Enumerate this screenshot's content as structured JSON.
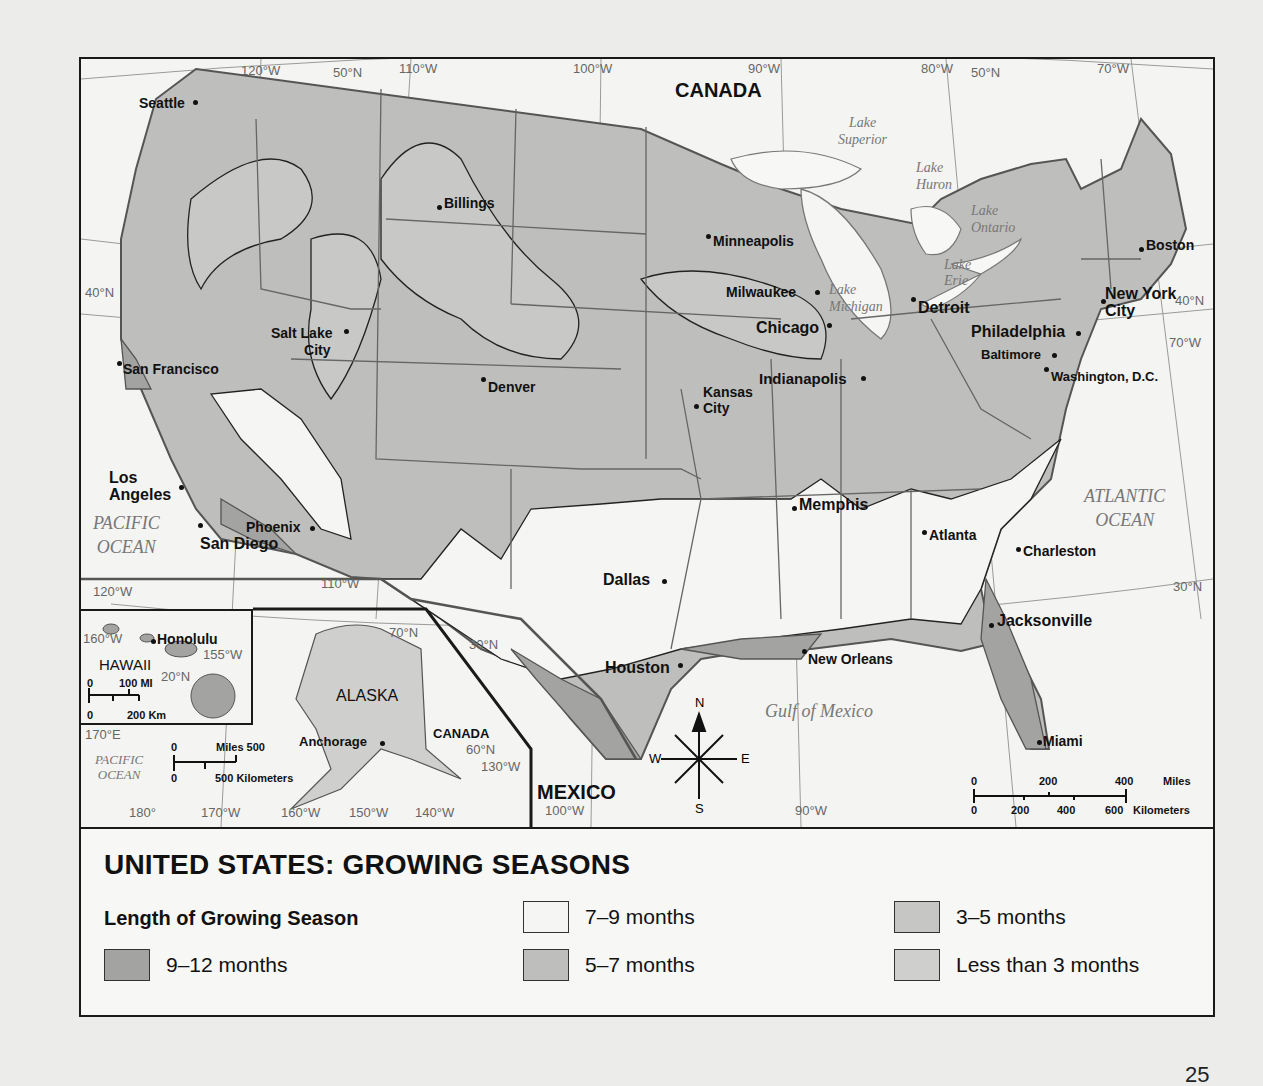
{
  "title": "UNITED STATES: GROWING SEASONS",
  "legend": {
    "heading": "Length of Growing Season",
    "items": [
      {
        "label": "9–12 months",
        "color": "#a3a3a1"
      },
      {
        "label": "7–9 months",
        "color": "#f5f5f3"
      },
      {
        "label": "5–7 months",
        "color": "#bebebc"
      },
      {
        "label": "3–5 months",
        "color": "#c6c6c4"
      },
      {
        "label": "Less than 3 months",
        "color": "#cfcfcd"
      }
    ]
  },
  "countries": {
    "canada": "CANADA",
    "mexico": "MEXICO",
    "canada_inset": "CANADA"
  },
  "water_bodies": {
    "pacific_ocean": [
      "PACIFIC",
      "OCEAN"
    ],
    "atlantic_ocean": [
      "ATLANTIC",
      "OCEAN"
    ],
    "gulf": "Gulf of Mexico",
    "lake_superior": [
      "Lake",
      "Superior"
    ],
    "lake_huron": [
      "Lake",
      "Huron"
    ],
    "lake_ontario": [
      "Lake",
      "Ontario"
    ],
    "lake_erie": [
      "Lake",
      "Erie"
    ],
    "lake_michigan": [
      "Lake",
      "Michigan"
    ],
    "pacific_inset": [
      "PACIFIC",
      "OCEAN"
    ]
  },
  "cities": {
    "seattle": "Seattle",
    "billings": "Billings",
    "minneapolis": "Minneapolis",
    "milwaukee": "Milwaukee",
    "chicago": "Chicago",
    "detroit": "Detroit",
    "boston": "Boston",
    "new_york": [
      "New York",
      "City"
    ],
    "philadelphia": "Philadelphia",
    "baltimore": "Baltimore",
    "washington": "Washington, D.C.",
    "salt_lake": [
      "Salt Lake",
      "City"
    ],
    "san_francisco": "San Francisco",
    "denver": "Denver",
    "kansas_city": [
      "Kansas",
      "City"
    ],
    "indianapolis": "Indianapolis",
    "los_angeles": [
      "Los",
      "Angeles"
    ],
    "phoenix": "Phoenix",
    "san_diego": "San Diego",
    "memphis": "Memphis",
    "atlanta": "Atlanta",
    "charleston": "Charleston",
    "dallas": "Dallas",
    "jacksonville": "Jacksonville",
    "houston": "Houston",
    "new_orleans": "New Orleans",
    "miami": "Miami",
    "honolulu": "Honolulu",
    "anchorage": "Anchorage"
  },
  "states_inset": {
    "hawaii": "HAWAII",
    "alaska": "ALASKA"
  },
  "coordinates": {
    "lon_120": "120°W",
    "lat_50_w": "50°N",
    "lon_110": "110°W",
    "lon_100": "100°W",
    "lon_90": "90°W",
    "lon_80": "80°W",
    "lat_50_e": "50°N",
    "lon_70": "70°W",
    "lat_40_w": "40°N",
    "lat_40_e": "40°N",
    "lon_70_e": "70°W",
    "lat_30_e": "30°N",
    "lon_120_s": "120°W",
    "lon_110_s": "110°W",
    "lat_30_w": "30°N",
    "lon_100_s": "100°W",
    "lon_90_s": "90°W",
    "hi_160": "160°W",
    "hi_155": "155°W",
    "hi_20": "20°N",
    "ak_70n": "70°N",
    "ak_60n": "60°N",
    "ak_130": "130°W",
    "ak_170e": "170°E",
    "ak_180": "180°",
    "ak_170w": "170°W",
    "ak_160": "160°W",
    "ak_150": "150°W",
    "ak_140": "140°W"
  },
  "compass": {
    "n": "N",
    "s": "S",
    "e": "E",
    "w": "W"
  },
  "scales": {
    "main": {
      "miles": [
        "0",
        "200",
        "400",
        "Miles"
      ],
      "km": [
        "0",
        "200",
        "400",
        "600",
        "Kilometers"
      ]
    },
    "hawaii": {
      "top": [
        "0",
        "100 MI"
      ],
      "bottom": [
        "0",
        "200 Km"
      ]
    },
    "alaska": {
      "top": [
        "0",
        "Miles 500"
      ],
      "bottom": [
        "0",
        "500 Kilometers"
      ]
    }
  },
  "page_number": "25"
}
